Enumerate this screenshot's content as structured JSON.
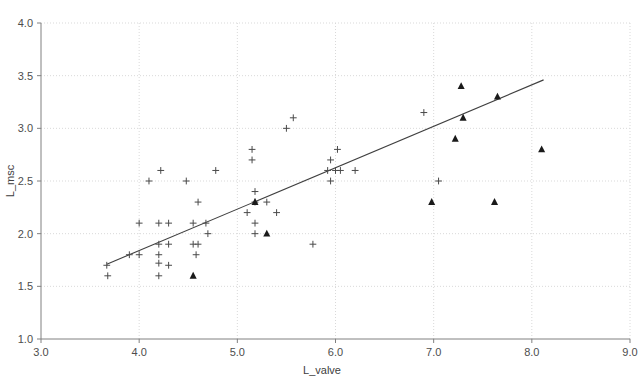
{
  "chart_data": {
    "type": "scatter",
    "title": "",
    "xlabel": "L_valve",
    "ylabel": "L_msc",
    "xlim": [
      3.0,
      9.0
    ],
    "ylim": [
      1.0,
      4.0
    ],
    "xticks": [
      "3.0",
      "4.0",
      "5.0",
      "6.0",
      "7.0",
      "8.0",
      "9.0"
    ],
    "yticks": [
      "1.0",
      "1.5",
      "2.0",
      "2.5",
      "3.0",
      "3.5",
      "4.0"
    ],
    "xtick_values": [
      3.0,
      4.0,
      5.0,
      6.0,
      7.0,
      8.0,
      9.0
    ],
    "ytick_values": [
      1.0,
      1.5,
      2.0,
      2.5,
      3.0,
      3.5,
      4.0
    ],
    "grid": true,
    "grid_color": "#d9d9d9",
    "axis_color": "#808080",
    "legend": "none",
    "series": [
      {
        "name": "plus-markers",
        "marker": "plus",
        "color": "#4a4a4a",
        "points": [
          [
            3.67,
            1.7
          ],
          [
            3.68,
            1.6
          ],
          [
            3.9,
            1.8
          ],
          [
            4.0,
            1.8
          ],
          [
            4.0,
            2.1
          ],
          [
            4.1,
            2.5
          ],
          [
            4.2,
            1.9
          ],
          [
            4.2,
            1.8
          ],
          [
            4.2,
            1.72
          ],
          [
            4.2,
            1.6
          ],
          [
            4.2,
            2.1
          ],
          [
            4.22,
            2.6
          ],
          [
            4.3,
            1.9
          ],
          [
            4.3,
            1.7
          ],
          [
            4.3,
            2.1
          ],
          [
            4.48,
            2.5
          ],
          [
            4.55,
            1.9
          ],
          [
            4.55,
            2.1
          ],
          [
            4.58,
            1.8
          ],
          [
            4.6,
            1.9
          ],
          [
            4.6,
            2.3
          ],
          [
            4.68,
            2.1
          ],
          [
            4.7,
            2.0
          ],
          [
            4.78,
            2.6
          ],
          [
            5.1,
            2.2
          ],
          [
            5.15,
            2.8
          ],
          [
            5.15,
            2.7
          ],
          [
            5.18,
            2.4
          ],
          [
            5.18,
            2.3
          ],
          [
            5.18,
            2.1
          ],
          [
            5.18,
            2.0
          ],
          [
            5.3,
            2.3
          ],
          [
            5.4,
            2.2
          ],
          [
            5.5,
            3.0
          ],
          [
            5.57,
            3.1
          ],
          [
            5.77,
            1.9
          ],
          [
            5.92,
            2.6
          ],
          [
            5.95,
            2.7
          ],
          [
            5.95,
            2.5
          ],
          [
            6.0,
            2.6
          ],
          [
            6.02,
            2.8
          ],
          [
            6.05,
            2.6
          ],
          [
            6.2,
            2.6
          ],
          [
            6.9,
            3.15
          ],
          [
            7.05,
            2.5
          ]
        ]
      },
      {
        "name": "triangle-markers",
        "marker": "triangle",
        "color": "#1a1a1a",
        "points": [
          [
            4.55,
            1.6
          ],
          [
            5.18,
            2.3
          ],
          [
            5.3,
            2.0
          ],
          [
            6.98,
            2.3
          ],
          [
            7.22,
            2.9
          ],
          [
            7.28,
            3.4
          ],
          [
            7.3,
            3.1
          ],
          [
            7.62,
            2.3
          ],
          [
            7.65,
            3.3
          ],
          [
            8.1,
            2.8
          ]
        ]
      }
    ],
    "trendline": {
      "name": "regression-line",
      "color": "#404040",
      "x_start": 3.67,
      "y_start": 1.71,
      "x_end": 8.12,
      "y_end": 3.46
    }
  }
}
